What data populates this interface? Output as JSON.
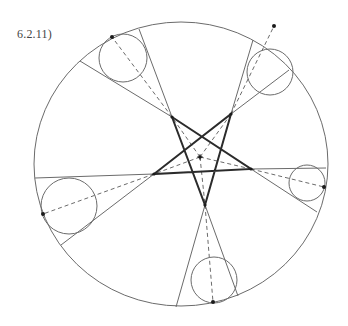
{
  "figure": {
    "label": "6.2.11)"
  },
  "colors": {
    "thin_line": "#6b6b6b",
    "thick_line": "#2b2b2b",
    "dash_line": "#6b6b6b",
    "dot": "#1a1a1a"
  },
  "geometry": {
    "outer_circle": {
      "cx": 181,
      "cy": 164,
      "rx": 147,
      "ry": 142
    },
    "center_point": {
      "x": 200,
      "y": 157
    },
    "pentagram_vertices": [
      {
        "name": "top-left",
        "x": 172,
        "y": 117
      },
      {
        "name": "top-right",
        "x": 231,
        "y": 114
      },
      {
        "name": "right",
        "x": 251,
        "y": 169
      },
      {
        "name": "bottom",
        "x": 205,
        "y": 205
      },
      {
        "name": "left",
        "x": 154,
        "y": 174
      }
    ],
    "sectors": [
      {
        "apex": [
          172,
          117
        ],
        "ray1": [
          80,
          61
        ],
        "ray2": [
          139,
          29
        ],
        "circle": {
          "cx": 123,
          "cy": 58,
          "r": 24
        },
        "contact": [
          112,
          37
        ]
      },
      {
        "apex": [
          231,
          114
        ],
        "ray1": [
          253,
          40
        ],
        "ray2": [
          289,
          70
        ],
        "circle": {
          "cx": 270,
          "cy": 72,
          "r": 23
        },
        "contact": [
          274,
          26
        ]
      },
      {
        "apex": [
          251,
          169
        ],
        "ray1": [
          326,
          168
        ],
        "ray2": [
          317,
          212
        ],
        "circle": {
          "cx": 307,
          "cy": 183,
          "r": 18
        },
        "contact": [
          324,
          187
        ]
      },
      {
        "apex": [
          205,
          205
        ],
        "ray1": [
          176,
          307
        ],
        "ray2": [
          238,
          296
        ],
        "circle": {
          "cx": 214,
          "cy": 280,
          "r": 23
        },
        "contact": [
          213,
          302
        ]
      },
      {
        "apex": [
          154,
          174
        ],
        "ray1": [
          35,
          178
        ],
        "ray2": [
          61,
          245
        ],
        "circle": {
          "cx": 69,
          "cy": 206,
          "r": 28
        },
        "contact": [
          43,
          214
        ]
      }
    ]
  }
}
